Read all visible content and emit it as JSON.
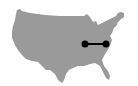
{
  "map": {
    "region": "Contiguous United States",
    "land_color": "#9a9a9a",
    "background_color": "#ffffff",
    "route": {
      "color": "#000000",
      "start": {
        "x": 85,
        "y": 44
      },
      "end": {
        "x": 106,
        "y": 44
      }
    }
  }
}
